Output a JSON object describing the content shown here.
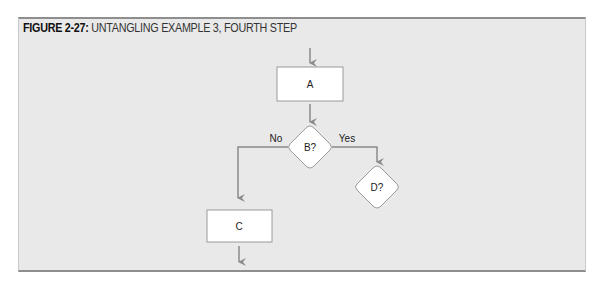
{
  "caption": {
    "figure_label": "FIGURE 2-27:",
    "title": " UNTANGLING EXAMPLE 3, FOURTH STEP"
  },
  "diagram": {
    "nodes": {
      "a": {
        "type": "process",
        "label": "A"
      },
      "b": {
        "type": "decision",
        "label": "B?"
      },
      "c": {
        "type": "process",
        "label": "C"
      },
      "d": {
        "type": "decision",
        "label": "D?"
      }
    },
    "edges": {
      "b_no": {
        "label": "No"
      },
      "b_yes": {
        "label": "Yes"
      }
    }
  },
  "colors": {
    "background": "#e9e9e9",
    "line": "#8a8a8a",
    "node_fill": "#ffffff",
    "node_stroke": "#9a9a9a"
  }
}
